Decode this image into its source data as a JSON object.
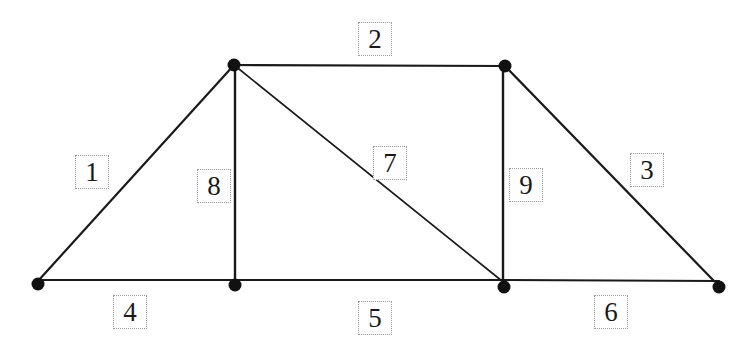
{
  "diagram": {
    "type": "truss",
    "colors": {
      "line": "#1a1a1a",
      "node": "#111111",
      "label_border": "#9a9a9a",
      "label_text": "#1a1a1a",
      "background": "#ffffff"
    },
    "nodes": [
      {
        "id": "A",
        "x": 38,
        "y": 284
      },
      {
        "id": "B",
        "x": 235,
        "y": 285
      },
      {
        "id": "C",
        "x": 504,
        "y": 287
      },
      {
        "id": "D",
        "x": 719,
        "y": 287
      },
      {
        "id": "E",
        "x": 234,
        "y": 65
      },
      {
        "id": "F",
        "x": 505,
        "y": 66
      }
    ],
    "members": [
      {
        "id": "1",
        "label": "1",
        "x1": 38,
        "y1": 281,
        "x2": 234,
        "y2": 65,
        "width": 2.2,
        "label_x": 75,
        "label_y": 155
      },
      {
        "id": "2",
        "label": "2",
        "x1": 234,
        "y1": 65,
        "x2": 505,
        "y2": 66,
        "width": 2.2,
        "label_x": 358,
        "label_y": 22
      },
      {
        "id": "3",
        "label": "3",
        "x1": 505,
        "y1": 66,
        "x2": 714,
        "y2": 281,
        "width": 2.2,
        "label_x": 630,
        "label_y": 153
      },
      {
        "id": "4",
        "label": "4",
        "x1": 38,
        "y1": 280,
        "x2": 235,
        "y2": 280,
        "width": 2.2,
        "label_x": 113,
        "label_y": 295
      },
      {
        "id": "5",
        "label": "5",
        "x1": 235,
        "y1": 280,
        "x2": 504,
        "y2": 280,
        "width": 2.2,
        "label_x": 358,
        "label_y": 301
      },
      {
        "id": "6",
        "label": "6",
        "x1": 504,
        "y1": 280,
        "x2": 719,
        "y2": 281,
        "width": 2.2,
        "label_x": 594,
        "label_y": 295
      },
      {
        "id": "7",
        "label": "7",
        "x1": 234,
        "y1": 65,
        "x2": 502,
        "y2": 281,
        "width": 1.7,
        "label_x": 373,
        "label_y": 146
      },
      {
        "id": "8",
        "label": "8",
        "x1": 235,
        "y1": 65,
        "x2": 235,
        "y2": 285,
        "width": 2.4,
        "label_x": 197,
        "label_y": 169
      },
      {
        "id": "9",
        "label": "9",
        "x1": 503,
        "y1": 66,
        "x2": 503,
        "y2": 287,
        "width": 2.4,
        "label_x": 509,
        "label_y": 168
      }
    ],
    "node_radius": 6.5
  }
}
